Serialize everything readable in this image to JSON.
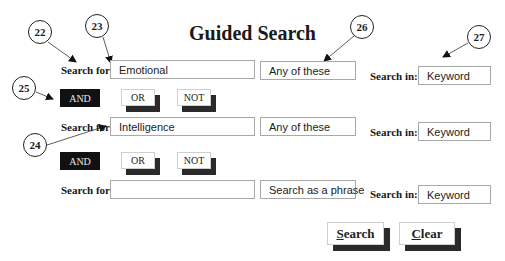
{
  "title": "Guided Search",
  "rows": [
    {
      "search_for_label": "Search for:",
      "term": "Emotional",
      "mode": "Any of these",
      "search_in_label": "Search in:",
      "field": "Keyword"
    },
    {
      "search_for_label": "Search for:",
      "term": "Intelligence",
      "mode": "Any of these",
      "search_in_label": "Search in:",
      "field": "Keyword"
    },
    {
      "search_for_label": "Search for:",
      "term": "",
      "mode": "Search as a phrase",
      "search_in_label": "Search in:",
      "field": "Keyword"
    }
  ],
  "operators": [
    {
      "and": "AND",
      "or": "OR",
      "not": "NOT",
      "selected": "AND"
    },
    {
      "and": "AND",
      "or": "OR",
      "not": "NOT",
      "selected": "AND"
    }
  ],
  "actions": {
    "search_underlined": "S",
    "search_rest": "earch",
    "clear_underlined": "C",
    "clear_rest": "lear"
  },
  "callouts": [
    "22",
    "23",
    "24",
    "25",
    "26",
    "27"
  ],
  "colors": {
    "selected_operator_bg": "#111111",
    "button_shadow": "#2a2a2a",
    "field_border": "#a8a8a8"
  }
}
